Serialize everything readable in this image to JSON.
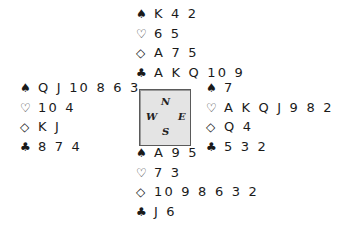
{
  "suit_symbols": {
    "spades": "♠",
    "hearts": "♡",
    "diamonds": "◇",
    "clubs": "♣"
  },
  "compass": {
    "north": "N",
    "west": "W",
    "east": "E",
    "south": "S"
  },
  "hands": {
    "north": {
      "spades": "K 4 2",
      "hearts": "6 5",
      "diamonds": "A 7 5",
      "clubs": "A K Q 10 9"
    },
    "west": {
      "spades": "Q J 10 8 6 3",
      "hearts": "10 4",
      "diamonds": "K J",
      "clubs": "8 7 4"
    },
    "east": {
      "spades": "7",
      "hearts": "A K Q J 9 8 2",
      "diamonds": "Q 4",
      "clubs": "5 3 2"
    },
    "south": {
      "spades": "A 9 5",
      "hearts": "7 3",
      "diamonds": "10 9 8 6 3 2",
      "clubs": "J 6"
    }
  }
}
